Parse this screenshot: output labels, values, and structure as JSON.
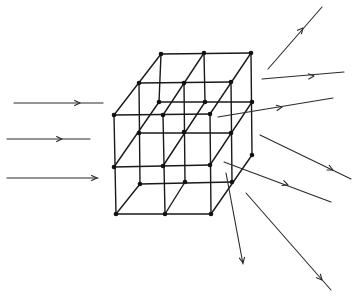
{
  "diagram": {
    "title": "Scattering of parallel incident rays by a 3D lattice",
    "colors": {
      "ink": "#1a1a1a",
      "background": "#ffffff"
    },
    "lattice": {
      "description": "3x3x3 cubic lattice drawn in oblique projection",
      "layers": {
        "front": [
          [
            114,
            115
          ],
          [
            163,
            115
          ],
          [
            210,
            114
          ],
          [
            114,
            167
          ],
          [
            163,
            166
          ],
          [
            210,
            165
          ],
          [
            116,
            214
          ],
          [
            165,
            214
          ],
          [
            211,
            214
          ]
        ],
        "middle": [
          [
            139,
            83
          ],
          [
            184,
            83
          ],
          [
            231,
            82
          ],
          [
            139,
            133
          ],
          [
            184,
            132
          ],
          [
            231,
            133
          ],
          [
            140,
            184
          ],
          [
            185,
            182
          ],
          [
            232,
            182
          ]
        ],
        "back": [
          [
            161,
            54
          ],
          [
            204,
            53
          ],
          [
            251,
            53
          ],
          [
            159,
            102
          ],
          [
            205,
            102
          ],
          [
            252,
            102
          ],
          [
            252,
            155
          ]
        ]
      },
      "edges": [
        [
          114,
          115,
          210,
          114
        ],
        [
          114,
          167,
          210,
          165
        ],
        [
          116,
          214,
          211,
          214
        ],
        [
          114,
          115,
          116,
          214
        ],
        [
          163,
          115,
          165,
          214
        ],
        [
          210,
          114,
          211,
          214
        ],
        [
          139,
          83,
          231,
          82
        ],
        [
          139,
          133,
          231,
          133
        ],
        [
          140,
          184,
          232,
          182
        ],
        [
          139,
          83,
          140,
          184
        ],
        [
          184,
          83,
          185,
          182
        ],
        [
          231,
          82,
          232,
          182
        ],
        [
          161,
          54,
          251,
          53
        ],
        [
          159,
          102,
          252,
          102
        ],
        [
          161,
          54,
          159,
          102
        ],
        [
          204,
          53,
          205,
          102
        ],
        [
          251,
          53,
          252,
          155
        ],
        [
          114,
          115,
          161,
          54
        ],
        [
          163,
          115,
          204,
          53
        ],
        [
          210,
          114,
          251,
          53
        ],
        [
          114,
          167,
          159,
          102
        ],
        [
          163,
          166,
          205,
          102
        ],
        [
          210,
          165,
          252,
          102
        ],
        [
          116,
          214,
          140,
          184
        ],
        [
          165,
          214,
          185,
          182
        ],
        [
          211,
          214,
          252,
          155
        ]
      ]
    },
    "incident_rays": [
      {
        "from": [
          14,
          103
        ],
        "to": [
          103,
          103
        ],
        "arrow_at": [
          80,
          103
        ]
      },
      {
        "from": [
          7,
          139
        ],
        "to": [
          90,
          139
        ],
        "arrow_at": [
          62,
          139
        ]
      },
      {
        "from": [
          7,
          178
        ],
        "to": [
          98,
          178
        ],
        "arrow_at": [
          97,
          178
        ]
      }
    ],
    "scattered_rays": [
      {
        "from": [
          268,
          69
        ],
        "to": [
          322,
          7
        ],
        "arrow_at": [
          303,
          28
        ]
      },
      {
        "from": [
          262,
          79
        ],
        "to": [
          344,
          72
        ],
        "arrow_at": [
          314,
          76
        ]
      },
      {
        "from": [
          218,
          117
        ],
        "to": [
          333,
          98
        ],
        "arrow_at": [
          282,
          107
        ]
      },
      {
        "from": [
          260,
          135
        ],
        "to": [
          351,
          179
        ],
        "arrow_at": [
          333,
          170
        ]
      },
      {
        "from": [
          224,
          162
        ],
        "to": [
          331,
          202
        ],
        "arrow_at": [
          288,
          185
        ]
      },
      {
        "from": [
          226,
          173
        ],
        "to": [
          243,
          264
        ],
        "arrow_at": [
          243,
          263
        ]
      },
      {
        "from": [
          246,
          193
        ],
        "to": [
          331,
          290
        ],
        "arrow_at": [
          322,
          280
        ]
      }
    ]
  }
}
